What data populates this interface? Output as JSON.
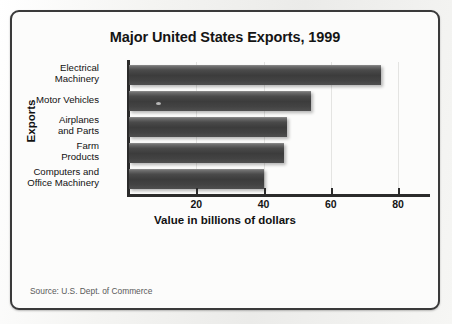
{
  "figure": {
    "source_note": "Source: U.S. Dept. of Commerce"
  },
  "chart_data": {
    "type": "bar",
    "orientation": "horizontal",
    "title": "Major United States Exports, 1999",
    "xlabel": "Value in billions of dollars",
    "ylabel": "Exports",
    "categories": [
      "Electrical Machinery",
      "Motor Vehicles",
      "Airplanes and Parts",
      "Farm Products",
      "Computers and Office Machinery"
    ],
    "category_lines": [
      [
        "Electrical",
        "Machinery"
      ],
      [
        "Motor Vehicles"
      ],
      [
        "Airplanes",
        "and Parts"
      ],
      [
        "Farm",
        "Products"
      ],
      [
        "Computers and",
        "Office Machinery"
      ]
    ],
    "values": [
      75,
      54,
      47,
      46,
      40
    ],
    "units": "billions of dollars",
    "xlim": [
      0,
      89.5
    ],
    "xticks": [
      20,
      40,
      60,
      80
    ],
    "xtick_labels": [
      "20",
      "40",
      "60",
      "80"
    ],
    "grid": true,
    "grid_axis": "x",
    "legend": false,
    "bar_color": "#3f3f3f",
    "frame_color": "#3a3a3a",
    "background_color": "#fcfcfb"
  }
}
